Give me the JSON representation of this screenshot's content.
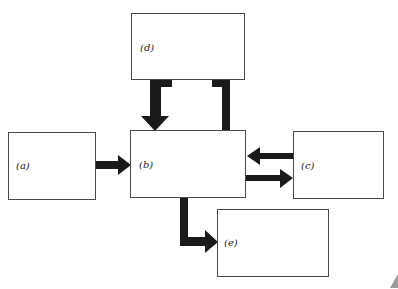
{
  "diagram": {
    "nodes": [
      {
        "id": "a",
        "label": "(a)"
      },
      {
        "id": "b",
        "label": "(b)"
      },
      {
        "id": "c",
        "label": "(c)"
      },
      {
        "id": "d",
        "label": "(d)"
      },
      {
        "id": "e",
        "label": "(e)"
      }
    ],
    "edges": [
      {
        "from": "a",
        "to": "b"
      },
      {
        "from": "b",
        "to": "c"
      },
      {
        "from": "c",
        "to": "b"
      },
      {
        "from": "d",
        "to": "b"
      },
      {
        "from": "b",
        "to": "d"
      },
      {
        "from": "b",
        "to": "e"
      }
    ],
    "colors": {
      "arrow": "#1a1a1a",
      "border": "#4a4a4a",
      "background": "#ffffff"
    }
  }
}
